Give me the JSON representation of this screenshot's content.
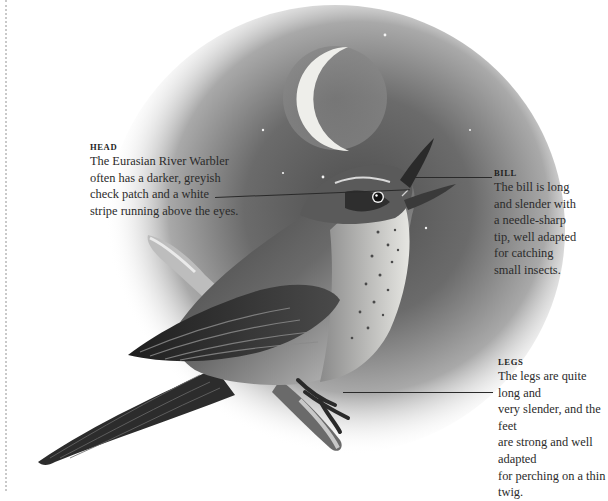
{
  "colors": {
    "background": "#ffffff",
    "text": "#2b2b2b",
    "sky_dark": "#5a5a5a",
    "moon_light": "#efefea",
    "leader_line": "#2a2a2a"
  },
  "illustration": {
    "subject": "Eurasian River Warbler singing on a branch at night",
    "elements": [
      "crescent-moon",
      "stars",
      "night-sky-vignette",
      "bird",
      "branch"
    ]
  },
  "callouts": {
    "head": {
      "heading": "HEAD",
      "body": "The Eurasian River Warbler\noften has a darker, greyish\ncheck patch and a white\nstripe running above the eyes."
    },
    "bill": {
      "heading": "BILL",
      "body": "The bill is long\nand slender with\na needle-sharp\ntip, well adapted\nfor catching\nsmall insects."
    },
    "legs": {
      "heading": "LEGS",
      "body": "The legs are quite long and\nvery slender, and the feet\nare strong and well adapted\nfor perching on a thin twig."
    }
  }
}
